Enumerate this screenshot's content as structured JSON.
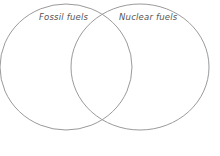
{
  "diagram": {
    "type": "venn",
    "sets": [
      {
        "label": "Fossil fuels",
        "shape": {
          "cx": 66,
          "cy": 67,
          "rx": 66,
          "ry": 63
        }
      },
      {
        "label": "Nuclear fuels",
        "shape": {
          "cx": 140,
          "cy": 67,
          "rx": 69,
          "ry": 63
        }
      }
    ],
    "stroke_color": "#9a9a9a",
    "background": "#ffffff"
  }
}
